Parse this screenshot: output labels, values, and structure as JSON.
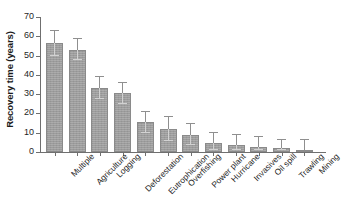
{
  "chart_data": {
    "type": "bar",
    "title": "",
    "xlabel": "",
    "ylabel": "Recovery time (years)",
    "ylim": [
      0,
      70
    ],
    "ytick_labels": [
      "70",
      "60",
      "50",
      "40",
      "30",
      "20",
      "10",
      "0"
    ],
    "ytick_values": [
      70,
      60,
      50,
      40,
      30,
      20,
      10,
      0
    ],
    "grid": false,
    "legend": "none",
    "error_bars": "symmetric",
    "bar_color": "#9c9c9c",
    "error_bar_color": "#8f8f8f",
    "axis_color": "#6f6f6f",
    "categories": [
      "Multiple",
      "Agriculture",
      "Logging",
      "Deforestation",
      "Eutrophication",
      "Overfishing",
      "Power plant",
      "Hurricane",
      "Invasives",
      "Oil spill",
      "Trawling",
      "Mining"
    ],
    "values": [
      56.3,
      53.0,
      33.3,
      30.5,
      15.5,
      12.0,
      8.9,
      4.6,
      3.6,
      2.5,
      2.0,
      1.0
    ],
    "errors": [
      6.4,
      5.5,
      5.7,
      5.4,
      5.4,
      6.2,
      5.5,
      5.5,
      5.0,
      5.2,
      4.4,
      5.0
    ]
  }
}
